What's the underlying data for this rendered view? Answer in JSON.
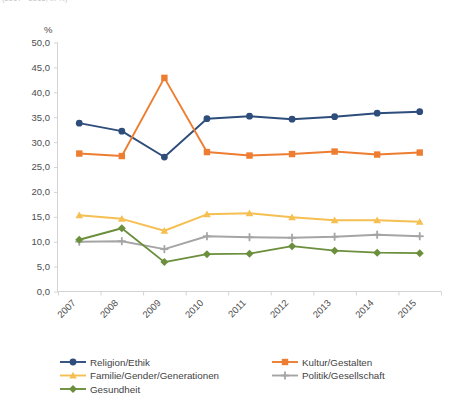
{
  "header": {
    "supertitle": "(2007 - 2015, in %)"
  },
  "axis": {
    "unit": "%",
    "y_ticks": [
      "0,0",
      "5,0",
      "10,0",
      "15,0",
      "20,0",
      "25,0",
      "30,0",
      "35,0",
      "40,0",
      "45,0",
      "50,0"
    ],
    "x_ticks": [
      "2007",
      "2008",
      "2009",
      "2010",
      "2011",
      "2012",
      "2013",
      "2014",
      "2015"
    ]
  },
  "legend": {
    "items": [
      {
        "label": "Religion/Ethik",
        "color": "#2e4d7b",
        "marker": "circle"
      },
      {
        "label": "Kultur/Gestalten",
        "color": "#ed7d31",
        "marker": "square"
      },
      {
        "label": "Familie/Gender/Generationen",
        "color": "#f5bf52",
        "marker": "triangle"
      },
      {
        "label": "Politik/Gesellschaft",
        "color": "#a5a5a5",
        "marker": "plus"
      },
      {
        "label": "Gesundheit",
        "color": "#6b8f3c",
        "marker": "diamond"
      }
    ]
  },
  "chart_data": {
    "type": "line",
    "title": "(2007 - 2015, in %)",
    "xlabel": "",
    "ylabel": "%",
    "ylim": [
      0,
      50
    ],
    "ytick_step": 5,
    "grid": false,
    "legend_position": "bottom",
    "categories": [
      "2007",
      "2008",
      "2009",
      "2010",
      "2011",
      "2012",
      "2013",
      "2014",
      "2015"
    ],
    "series": [
      {
        "name": "Religion/Ethik",
        "color": "#2e4d7b",
        "marker": "circle",
        "values": [
          33.8,
          32.2,
          27.0,
          34.7,
          35.2,
          34.6,
          35.1,
          35.8,
          36.1
        ]
      },
      {
        "name": "Kultur/Gestalten",
        "color": "#ed7d31",
        "marker": "square",
        "values": [
          27.7,
          27.2,
          42.9,
          28.0,
          27.3,
          27.6,
          28.1,
          27.5,
          27.9
        ]
      },
      {
        "name": "Familie/Gender/Generationen",
        "color": "#f5bf52",
        "marker": "triangle",
        "values": [
          15.3,
          14.6,
          12.2,
          15.5,
          15.7,
          14.9,
          14.3,
          14.3,
          14.0
        ]
      },
      {
        "name": "Politik/Gesellschaft",
        "color": "#a5a5a5",
        "marker": "plus",
        "values": [
          10.0,
          10.1,
          8.5,
          11.1,
          10.9,
          10.8,
          11.0,
          11.4,
          11.1
        ]
      },
      {
        "name": "Gesundheit",
        "color": "#6b8f3c",
        "marker": "diamond",
        "values": [
          10.4,
          12.7,
          5.9,
          7.5,
          7.6,
          9.1,
          8.2,
          7.8,
          7.7
        ]
      }
    ]
  }
}
